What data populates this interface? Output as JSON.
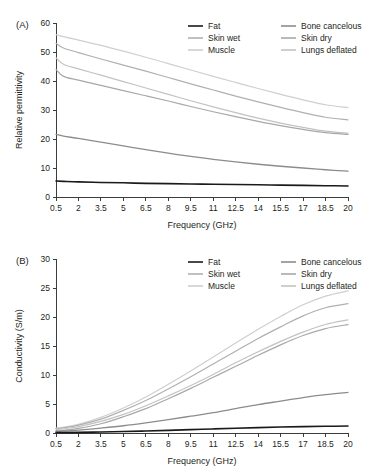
{
  "figure": {
    "panel_a_label": "(A)",
    "panel_b_label": "(B)"
  },
  "legend": {
    "entries": [
      {
        "label": "Fat",
        "color": "#1a1a1a",
        "width": 1.6
      },
      {
        "label": "Bone cancelous",
        "color": "#8c8c8c",
        "width": 1.3
      },
      {
        "label": "Skin wet",
        "color": "#b0b0b0",
        "width": 1.2
      },
      {
        "label": "Skin dry",
        "color": "#a8a8a8",
        "width": 1.2
      },
      {
        "label": "Muscle",
        "color": "#cfcfcf",
        "width": 1.2
      },
      {
        "label": "Lungs deflated",
        "color": "#c2c2c2",
        "width": 1.2
      }
    ]
  },
  "chart_data": [
    {
      "type": "line",
      "panel": "(A)",
      "title": "",
      "xlabel": "Frequency (GHz)",
      "ylabel": "Relative permittivity",
      "xlim": [
        0.5,
        20
      ],
      "ylim": [
        0,
        60
      ],
      "xticks": [
        0.5,
        2,
        3.5,
        5,
        6.5,
        8,
        9.5,
        11,
        12.5,
        14,
        15.5,
        17,
        18.5,
        20
      ],
      "yticks": [
        0,
        10,
        20,
        30,
        40,
        50,
        60
      ],
      "xtick_labels": [
        "0.5",
        "2",
        "3.5",
        "5",
        "6.5",
        "8",
        "9.5",
        "11",
        "12.5",
        "14",
        "15.5",
        "17",
        "18.5",
        "20"
      ],
      "ytick_labels": [
        "0",
        "10",
        "20",
        "30",
        "40",
        "50",
        "60"
      ],
      "grid": false,
      "legend_position": "top-right",
      "x": [
        0.5,
        1,
        2,
        3.5,
        5,
        6.5,
        8,
        9.5,
        11,
        12.5,
        14,
        15.5,
        17,
        18.5,
        20
      ],
      "series": [
        {
          "name": "Muscle",
          "color": "#cfcfcf",
          "width": 1.2,
          "values": [
            56.0,
            55.3,
            54.1,
            52.3,
            50.3,
            48.2,
            46.0,
            43.8,
            41.6,
            39.5,
            37.4,
            35.4,
            33.5,
            31.8,
            30.8
          ]
        },
        {
          "name": "Skin wet",
          "color": "#b0b0b0",
          "width": 1.2,
          "values": [
            53.0,
            51.4,
            49.8,
            47.6,
            45.5,
            43.4,
            41.2,
            39.0,
            36.9,
            34.8,
            32.8,
            30.9,
            29.1,
            27.5,
            26.6
          ]
        },
        {
          "name": "Lungs deflated",
          "color": "#c2c2c2",
          "width": 1.2,
          "values": [
            48.0,
            45.8,
            44.2,
            42.0,
            39.8,
            37.6,
            35.4,
            33.2,
            31.1,
            29.1,
            27.2,
            25.5,
            24.0,
            22.7,
            22.0
          ]
        },
        {
          "name": "Skin dry",
          "color": "#a8a8a8",
          "width": 1.2,
          "values": [
            44.0,
            41.6,
            40.3,
            38.5,
            36.7,
            34.9,
            33.1,
            31.2,
            29.4,
            27.7,
            26.1,
            24.6,
            23.3,
            22.2,
            21.6
          ]
        },
        {
          "name": "Bone cancelous",
          "color": "#8c8c8c",
          "width": 1.3,
          "values": [
            21.6,
            21.0,
            20.2,
            18.9,
            17.6,
            16.3,
            15.1,
            14.0,
            13.0,
            12.1,
            11.3,
            10.6,
            10.0,
            9.4,
            8.9
          ]
        },
        {
          "name": "Fat",
          "color": "#1a1a1a",
          "width": 1.6,
          "values": [
            5.5,
            5.4,
            5.2,
            5.0,
            4.9,
            4.7,
            4.6,
            4.5,
            4.4,
            4.3,
            4.2,
            4.1,
            4.0,
            3.9,
            3.8
          ]
        }
      ]
    },
    {
      "type": "line",
      "panel": "(B)",
      "title": "",
      "xlabel": "Frequency (GHz)",
      "ylabel": "Conductivity (S/m)",
      "xlim": [
        0.5,
        20
      ],
      "ylim": [
        0,
        30
      ],
      "xticks": [
        0.5,
        2,
        3.5,
        5,
        6.5,
        8,
        9.5,
        11,
        12.5,
        14,
        15.5,
        17,
        18.5,
        20
      ],
      "yticks": [
        0,
        5,
        10,
        15,
        20,
        25,
        30
      ],
      "xtick_labels": [
        "0.5",
        "2",
        "3.5",
        "5",
        "6.5",
        "8",
        "9.5",
        "11",
        "12.5",
        "14",
        "15.5",
        "17",
        "18.5",
        "20"
      ],
      "ytick_labels": [
        "0",
        "5",
        "10",
        "15",
        "20",
        "25",
        "30"
      ],
      "grid": false,
      "legend_position": "top-right",
      "x": [
        0.5,
        1,
        2,
        3.5,
        5,
        6.5,
        8,
        9.5,
        11,
        12.5,
        14,
        15.5,
        17,
        18.5,
        20
      ],
      "series": [
        {
          "name": "Muscle",
          "color": "#cfcfcf",
          "width": 1.2,
          "values": [
            0.85,
            1.0,
            1.5,
            2.7,
            4.3,
            6.2,
            8.4,
            10.7,
            13.1,
            15.5,
            17.9,
            20.1,
            22.1,
            23.6,
            24.5
          ]
        },
        {
          "name": "Skin wet",
          "color": "#b0b0b0",
          "width": 1.2,
          "values": [
            0.75,
            0.9,
            1.35,
            2.4,
            3.9,
            5.6,
            7.6,
            9.7,
            11.9,
            14.1,
            16.3,
            18.3,
            20.2,
            21.6,
            22.3
          ]
        },
        {
          "name": "Lungs deflated",
          "color": "#c2c2c2",
          "width": 1.2,
          "values": [
            0.6,
            0.72,
            1.1,
            2.0,
            3.2,
            4.7,
            6.4,
            8.2,
            10.1,
            12.1,
            14.0,
            15.8,
            17.4,
            18.7,
            19.5
          ]
        },
        {
          "name": "Skin dry",
          "color": "#a8a8a8",
          "width": 1.2,
          "values": [
            0.35,
            0.45,
            0.8,
            1.6,
            2.8,
            4.2,
            5.9,
            7.7,
            9.6,
            11.5,
            13.4,
            15.2,
            16.8,
            18.0,
            18.7
          ]
        },
        {
          "name": "Bone cancelous",
          "color": "#8c8c8c",
          "width": 1.3,
          "values": [
            0.28,
            0.33,
            0.5,
            0.85,
            1.25,
            1.75,
            2.3,
            2.9,
            3.5,
            4.2,
            4.9,
            5.5,
            6.1,
            6.6,
            7.0
          ]
        },
        {
          "name": "Fat",
          "color": "#1a1a1a",
          "width": 1.6,
          "values": [
            0.06,
            0.07,
            0.1,
            0.17,
            0.25,
            0.35,
            0.46,
            0.58,
            0.7,
            0.82,
            0.93,
            1.03,
            1.1,
            1.16,
            1.2
          ]
        }
      ]
    }
  ]
}
